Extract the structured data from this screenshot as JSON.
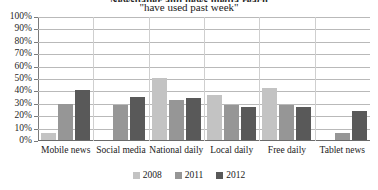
{
  "chart_data": {
    "type": "bar",
    "title": "Newspaper and news media reach",
    "subtitle": "\"have used past week\"",
    "categories": [
      "Mobile news",
      "Social media",
      "National daily",
      "Local daily",
      "Free daily",
      "Tablet news"
    ],
    "series": [
      {
        "name": "2008",
        "color": "#c3c3c3",
        "values": [
          6,
          0,
          50,
          36,
          42,
          0
        ]
      },
      {
        "name": "2011",
        "color": "#969696",
        "values": [
          29,
          28,
          32,
          28,
          28,
          6
        ]
      },
      {
        "name": "2012",
        "color": "#595959",
        "values": [
          40,
          35,
          34,
          27,
          27,
          23
        ]
      }
    ],
    "xlabel": "",
    "ylabel": "",
    "ylim": [
      0,
      100
    ],
    "ytick_labels": [
      "100%",
      "90%",
      "80%",
      "70%",
      "60%",
      "50%",
      "40%",
      "30%",
      "20%",
      "10%",
      "0%"
    ],
    "ytick_values": [
      100,
      90,
      80,
      70,
      60,
      50,
      40,
      30,
      20,
      10,
      0
    ],
    "grid": true,
    "legend_position": "bottom"
  }
}
